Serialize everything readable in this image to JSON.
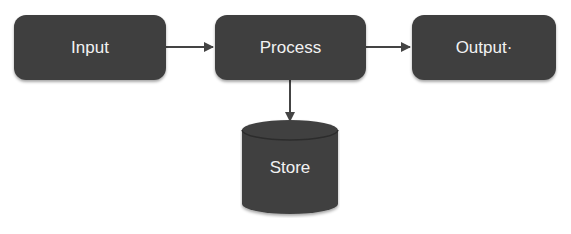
{
  "diagram": {
    "type": "flowchart",
    "nodes": [
      {
        "id": "input",
        "label": "Input",
        "shape": "rounded-rect"
      },
      {
        "id": "process",
        "label": "Process",
        "shape": "rounded-rect"
      },
      {
        "id": "output",
        "label": "Output·",
        "shape": "rounded-rect"
      },
      {
        "id": "store",
        "label": "Store",
        "shape": "cylinder"
      }
    ],
    "edges": [
      {
        "from": "input",
        "to": "process"
      },
      {
        "from": "process",
        "to": "output"
      },
      {
        "from": "process",
        "to": "store"
      }
    ],
    "colors": {
      "node_fill": "#3f3f3f",
      "node_text": "#f2f2f2",
      "edge": "#444444",
      "background": "#ffffff"
    }
  }
}
